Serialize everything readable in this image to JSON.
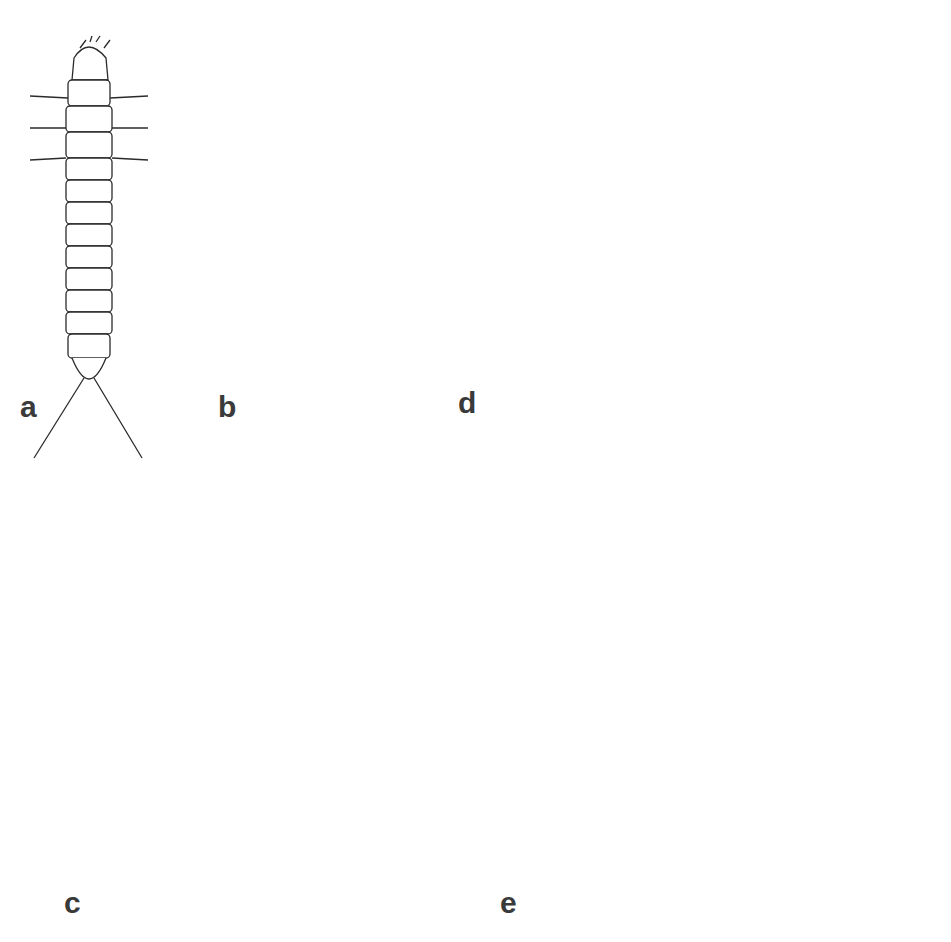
{
  "figure": {
    "panels": [
      {
        "id": "a",
        "label": "a",
        "subject": "elongate larva, dorsal view"
      },
      {
        "id": "b",
        "label": "b",
        "subject": "larva, spiculate dorsal view"
      },
      {
        "id": "c",
        "label": "c",
        "subject": "C-shaped larva, lateral view"
      },
      {
        "id": "d",
        "label": "d",
        "subject": "pupa, lateral view with setae"
      },
      {
        "id": "e",
        "label": "e",
        "subject": "adult fly, dorsal view, wings spread"
      }
    ],
    "colors": {
      "ink": "#2b2b2b",
      "label": "#3a3a3a",
      "wing_shade": "#9a9a9a",
      "background": "#ffffff"
    }
  }
}
